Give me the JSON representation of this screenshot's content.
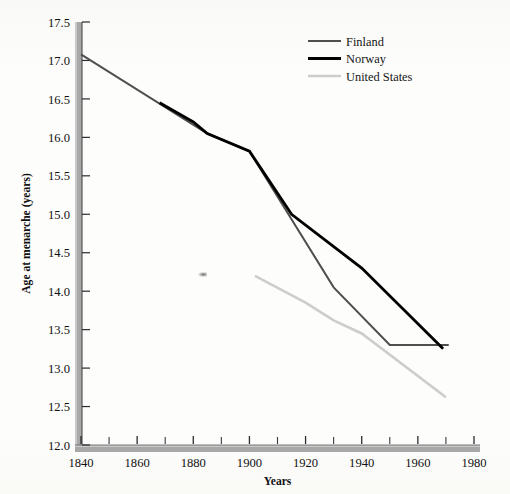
{
  "chart_data": {
    "type": "line",
    "title": "",
    "xlabel": "Years",
    "ylabel": "Age at menarche (years)",
    "xlim": [
      1840,
      1980
    ],
    "ylim": [
      12.0,
      17.5
    ],
    "xticks": [
      1840,
      1860,
      1880,
      1900,
      1920,
      1940,
      1960,
      1980
    ],
    "xtick_labels": [
      "1840",
      "1860",
      "1880",
      "1900",
      "1920",
      "1940",
      "1960",
      "1980"
    ],
    "xminor_ticks": [
      1850,
      1870,
      1890,
      1910,
      1930,
      1950,
      1970
    ],
    "yticks": [
      12.0,
      12.5,
      13.0,
      13.5,
      14.0,
      14.5,
      15.0,
      15.5,
      16.0,
      16.5,
      17.0,
      17.5
    ],
    "ytick_labels": [
      "12.0",
      "12.5",
      "13.0",
      "13.5",
      "14.0",
      "14.5",
      "15.0",
      "15.5",
      "16.0",
      "16.5",
      "17.0",
      "17.5"
    ],
    "grid": false,
    "legend_position": "top-right",
    "series": [
      {
        "name": "Finland",
        "color": "#4f4f4f",
        "width": 2.0,
        "x": [
          1840,
          1885,
          1900,
          1930,
          1950,
          1971
        ],
        "values": [
          17.08,
          16.05,
          15.82,
          14.05,
          13.3,
          13.3
        ]
      },
      {
        "name": "Norway",
        "color": "#000000",
        "width": 2.8,
        "x": [
          1868,
          1880,
          1885,
          1900,
          1915,
          1940,
          1969
        ],
        "values": [
          16.45,
          16.2,
          16.05,
          15.82,
          15.0,
          14.3,
          13.25
        ]
      },
      {
        "name": "United States",
        "color": "#cdcdcd",
        "width": 2.6,
        "x": [
          1902,
          1920,
          1930,
          1940,
          1970
        ],
        "values": [
          14.2,
          13.85,
          13.62,
          13.45,
          12.62
        ]
      }
    ]
  },
  "legend": {
    "entries": [
      {
        "label": "Finland"
      },
      {
        "label": "Norway"
      },
      {
        "label": "United States"
      }
    ]
  },
  "axes": {
    "x_axis_title": "Years",
    "y_axis_title": "Age at menarche (years)"
  }
}
